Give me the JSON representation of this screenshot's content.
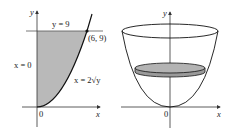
{
  "left_figure": {
    "axis_x_label": "x",
    "axis_y_label": "y",
    "origin_label": "0",
    "line_top_label": "y = 9",
    "point_label": "(6, 9)",
    "left_boundary_label": "x = 0",
    "curve_label": "x = 2√y",
    "region_fill": "#b9b9b9"
  },
  "right_figure": {
    "axis_x_label": "x",
    "axis_y_label": "y",
    "origin_label": "0",
    "disk_fill": "#b3b3b3",
    "description": "Paraboloid bowl formed by rotating x = 2√y about the y-axis, with a horizontal disk slice"
  },
  "colors": {
    "stroke": "#1a1a1a",
    "axis": "#333333"
  }
}
